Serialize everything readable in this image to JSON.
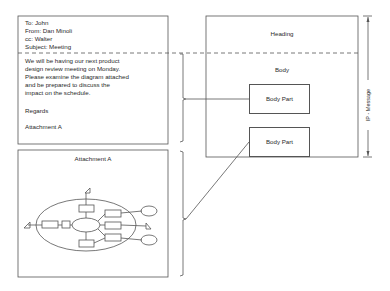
{
  "memo": {
    "heading": {
      "to": "To: John",
      "from": "From: Dan Minoli",
      "cc": "cc: Walter",
      "subject": "Subject: Meeting"
    },
    "body": {
      "lines": [
        "We will be having our next product",
        "design review meeting on Monday.",
        "Please examine the diagram attached",
        "and be prepared to discuss the",
        "impact on the schedule."
      ],
      "closing": "Regards",
      "attachment_ref": "Attachment A"
    }
  },
  "attachment": {
    "title": "Attachment A"
  },
  "structure": {
    "heading_label": "Heading",
    "body_label": "Body",
    "body_parts": [
      "Body Part",
      "Body Part"
    ],
    "dimension_label": "IP - Message"
  },
  "colors": {
    "line": "#555555",
    "text": "#2a2a2a",
    "background": "#ffffff"
  }
}
